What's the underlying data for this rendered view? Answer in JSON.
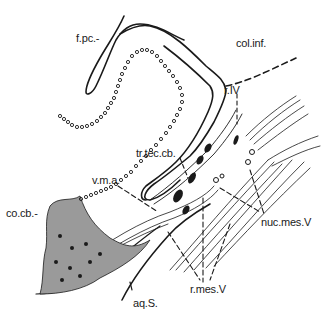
{
  "figure": {
    "type": "anatomical line drawing",
    "ink_color": "#1a1a1a",
    "background": "#ffffff"
  },
  "labels": [
    {
      "id": "fpc",
      "text": "f.pc.-",
      "x": 76,
      "y": 32
    },
    {
      "id": "colinf",
      "text": "col.inf.",
      "x": 236,
      "y": 37
    },
    {
      "id": "rIV",
      "text": "r.IV",
      "x": 224,
      "y": 84
    },
    {
      "id": "trteccb",
      "text": "tr.tec.cb.",
      "x": 136,
      "y": 147
    },
    {
      "id": "vma",
      "text": "v.m.a.",
      "x": 92,
      "y": 174
    },
    {
      "id": "cocb",
      "text": "co.cb.-",
      "x": 6,
      "y": 207
    },
    {
      "id": "nucmesV",
      "text": "nuc.mes.V",
      "x": 261,
      "y": 216
    },
    {
      "id": "rmesV",
      "text": "r.mes.V",
      "x": 190,
      "y": 283
    },
    {
      "id": "aqS",
      "text": "aq.S.",
      "x": 133,
      "y": 297
    }
  ]
}
